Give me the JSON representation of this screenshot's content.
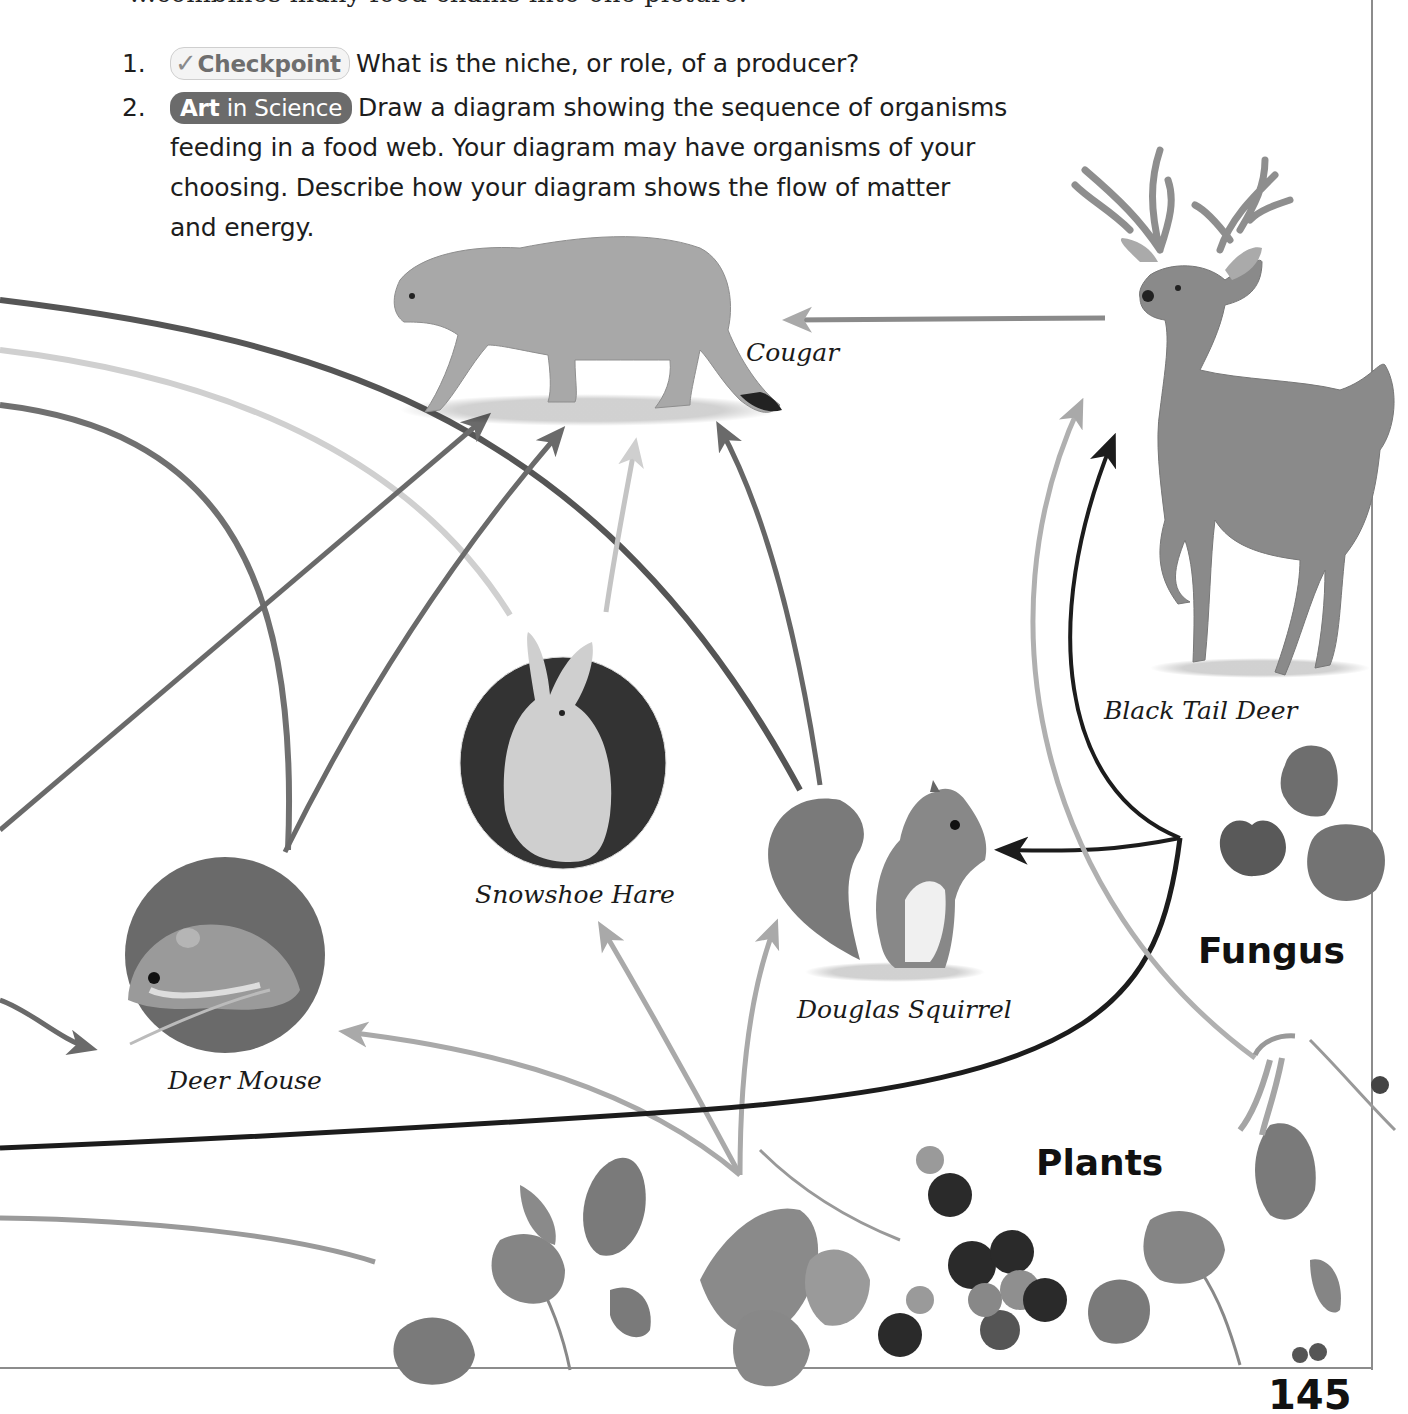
{
  "page": {
    "intro_fragment": "…combines many food chains into one picture.",
    "page_number": "145"
  },
  "questions": [
    {
      "number": "1.",
      "badge": "Checkpoint",
      "badge_icon": "checkmark-icon",
      "text": "What is the niche, or role, of a producer?"
    },
    {
      "number": "2.",
      "badge_bold": "Art",
      "badge_rest": " in Science",
      "text_line1": "Draw a diagram showing the sequence of organisms",
      "text_line2": "feeding in a food web. Your diagram may have organisms of your",
      "text_line3": "choosing. Describe how your diagram shows the flow of matter",
      "text_line4": "and energy."
    }
  ],
  "diagram": {
    "organisms": {
      "cougar": "Cougar",
      "deer": "Black Tail Deer",
      "hare": "Snowshoe Hare",
      "squirrel": "Douglas Squirrel",
      "mouse": "Deer Mouse"
    },
    "groups": {
      "fungus": "Fungus",
      "plants": "Plants"
    },
    "colors": {
      "arrow_dark": "#1c1c1c",
      "arrow_mid": "#6a6a6a",
      "arrow_light": "#a9a9a9",
      "arrow_pale": "#d2d2d2",
      "frame": "#8c8c8c"
    }
  }
}
